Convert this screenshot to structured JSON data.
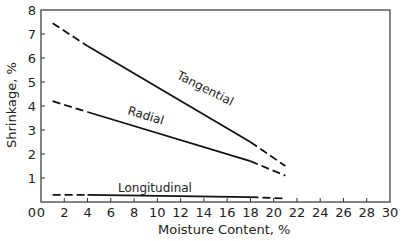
{
  "chart_data": {
    "type": "line",
    "title": "",
    "xlabel": "Moisture Content, %",
    "ylabel": "Shrinkage, %",
    "xlim": [
      0,
      30
    ],
    "ylim": [
      0,
      8
    ],
    "xticks": [
      0,
      2,
      4,
      6,
      8,
      10,
      12,
      14,
      16,
      18,
      20,
      22,
      24,
      26,
      28,
      30
    ],
    "yticks": [
      1,
      2,
      3,
      4,
      5,
      6,
      7,
      8
    ],
    "grid": false,
    "legend": "inline labels",
    "series": [
      {
        "name": "Tangential",
        "x": [
          1,
          4,
          18,
          21
        ],
        "y": [
          7.45,
          6.5,
          2.5,
          1.5
        ],
        "solid_range": [
          4,
          18
        ],
        "dashed_ranges": [
          [
            1,
            4
          ],
          [
            18,
            21
          ]
        ]
      },
      {
        "name": "Radial",
        "x": [
          1,
          4,
          18,
          21
        ],
        "y": [
          4.2,
          3.75,
          1.7,
          1.1
        ],
        "solid_range": [
          4,
          18
        ],
        "dashed_ranges": [
          [
            1,
            4
          ],
          [
            18,
            21
          ]
        ]
      },
      {
        "name": "Longitudinal",
        "x": [
          1,
          4,
          18,
          21
        ],
        "y": [
          0.3,
          0.3,
          0.2,
          0.15
        ],
        "solid_range": [
          4,
          18
        ],
        "dashed_ranges": [
          [
            1,
            4
          ],
          [
            18,
            21
          ]
        ]
      }
    ]
  },
  "labels": {
    "xlabel": "Moisture Content, %",
    "ylabel": "Shrinkage, %",
    "tangential": "Tangential",
    "radial": "Radial",
    "longitudinal": "Longitudinal"
  }
}
